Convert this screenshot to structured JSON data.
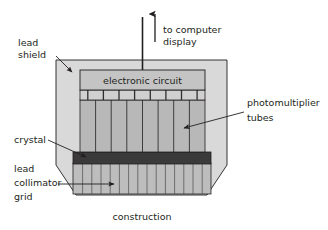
{
  "figure": {
    "title": "",
    "caption": "construction"
  },
  "labels": {
    "lead_shield_line1": "lead",
    "lead_shield_line2": "shield",
    "to_computer_line1": "to computer",
    "to_computer_line2": "display",
    "electronic_circuit": "electronic circuit",
    "photomultiplier_line1": "photomultiplier",
    "photomultiplier_line2": "tubes",
    "crystal": "crystal",
    "lead_collimator_line1": "lead",
    "lead_collimator_line2": "collimator",
    "lead_collimator_line3": "grid"
  },
  "colors": {
    "outline": "#231f20",
    "text": "#231f20",
    "lead_shield_fill": "#d9d9d9",
    "circuit_fill": "#c4c4c4",
    "connector_fill": "#d0d0d0",
    "pmt_fill": "#b8b8b8",
    "crystal_fill": "#3a3a3a",
    "collimator_fill": "#bdbdbd",
    "background": "#ffffff"
  },
  "structure": {
    "photomultiplier_tube_count": 8,
    "connector_segment_count": 8,
    "collimator_septa_count": 15,
    "shield_shape": "octagonal-chamfered-rectangle"
  },
  "icons": {
    "output_arrow": "up-arrow",
    "leader_lead_shield": "arrow-down-right",
    "leader_photomultiplier": "arrow-down-left",
    "leader_crystal": "arrow-right",
    "leader_collimator": "arrow-right"
  }
}
